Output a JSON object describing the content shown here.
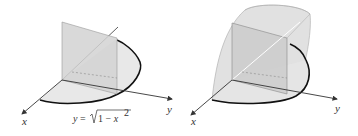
{
  "figure": {
    "left_panel": {
      "axis_labels": {
        "x": "x",
        "y": "y"
      },
      "equation": {
        "lhs": "y = ",
        "radical_content": "1 − x",
        "exponent": "2"
      },
      "description": "Quarter-disk base in xy-plane bounded by y = sqrt(1 - x^2) with a square cross-section perpendicular to the x-axis"
    },
    "right_panel": {
      "axis_labels": {
        "x": "x",
        "y": "y"
      },
      "description": "Solid with square cross-sections over the quarter-disk base"
    },
    "colors": {
      "axis": "#333333",
      "boundary_curve": "#111111",
      "base_fill": "#e6e6e6",
      "square_fill": "#cfcfcf",
      "solid_fill": "#dcdcdc"
    }
  }
}
